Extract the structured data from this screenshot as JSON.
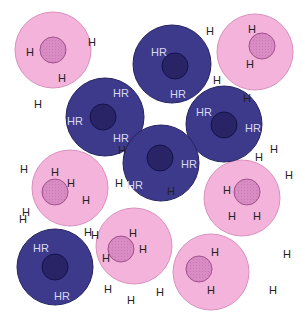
{
  "colors": {
    "pink_outer": "#f4b3da",
    "pink_outer_stroke": "#d890bd",
    "pink_inner": "#d98cc4",
    "pink_inner_stroke": "#a0508a",
    "dark_outer": "#3d3a8c",
    "dark_outer_stroke": "#25235e",
    "dark_inner": "#282466",
    "dark_inner_stroke": "#15134a",
    "h_label": "#222222",
    "hr_label": "#d8d8ee"
  },
  "labels": {
    "hydrogen": "H",
    "hydrogen_receptor": "HR"
  },
  "pink_cells": [
    {
      "labels": [
        "H",
        "H",
        "H"
      ]
    },
    {
      "labels": [
        "H",
        "H"
      ]
    },
    {
      "labels": [
        "H",
        "H",
        "H"
      ]
    },
    {
      "labels": [
        "H",
        "H",
        "H"
      ]
    },
    {
      "labels": [
        "H",
        "H"
      ]
    },
    {
      "labels": [
        "H",
        "H"
      ]
    }
  ],
  "dark_cells": [
    {
      "labels": [
        "HR",
        "HR"
      ]
    },
    {
      "labels": [
        "HR",
        "HR",
        "HR"
      ]
    },
    {
      "labels": [
        "HR",
        "HR"
      ]
    },
    {
      "labels": [
        "HR",
        "HR",
        "H"
      ]
    },
    {
      "labels": [
        "HR",
        "HR"
      ]
    }
  ],
  "free_labels": [
    "H",
    "H",
    "H",
    "H",
    "H",
    "H",
    "H",
    "H",
    "H",
    "H",
    "H",
    "H",
    "H",
    "H",
    "H",
    "H",
    "H",
    "H",
    "H",
    "H"
  ]
}
